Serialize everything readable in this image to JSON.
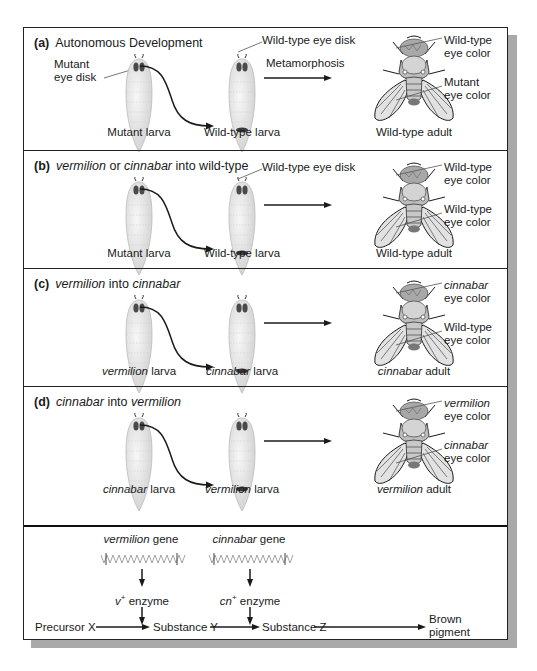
{
  "panels": [
    {
      "letter": "(a)",
      "title_parts": [
        {
          "text": "Autonomous Development",
          "italic": false
        }
      ],
      "left_label_1": "Mutant",
      "left_label_2": "eye disk",
      "donor_larva": [
        {
          "text": "Mutant",
          "italic": false
        },
        {
          "text": " larva",
          "italic": false
        }
      ],
      "host_larva": [
        {
          "text": "Wild-type",
          "italic": false
        },
        {
          "text": " larva",
          "italic": false
        }
      ],
      "host_disk_label": "Wild-type eye disk",
      "arrow_label": "Metamorphosis",
      "adult": [
        {
          "text": "Wild-type",
          "italic": false
        },
        {
          "text": " adult",
          "italic": false
        }
      ],
      "eye_top": [
        {
          "text": "Wild-type",
          "italic": false
        },
        {
          "text": "eye color",
          "italic": false
        }
      ],
      "eye_bottom": [
        {
          "text": "Mutant",
          "italic": false
        },
        {
          "text": "eye color",
          "italic": false
        }
      ]
    },
    {
      "letter": "(b)",
      "title_parts": [
        {
          "text": "vermilion",
          "italic": true
        },
        {
          "text": " or ",
          "italic": false
        },
        {
          "text": "cinnabar",
          "italic": true
        },
        {
          "text": " into wild-type",
          "italic": false
        }
      ],
      "donor_larva": [
        {
          "text": "Mutant",
          "italic": false
        },
        {
          "text": " larva",
          "italic": false
        }
      ],
      "host_larva": [
        {
          "text": "Wild-type",
          "italic": false
        },
        {
          "text": " larva",
          "italic": false
        }
      ],
      "host_disk_label": "Wild-type eye disk",
      "adult": [
        {
          "text": "Wild-type",
          "italic": false
        },
        {
          "text": " adult",
          "italic": false
        }
      ],
      "eye_top": [
        {
          "text": "Wild-type",
          "italic": false
        },
        {
          "text": "eye color",
          "italic": false
        }
      ],
      "eye_bottom": [
        {
          "text": "Wild-type",
          "italic": false
        },
        {
          "text": "eye color",
          "italic": false
        }
      ]
    },
    {
      "letter": "(c)",
      "title_parts": [
        {
          "text": "vermilion",
          "italic": true
        },
        {
          "text": " into ",
          "italic": false
        },
        {
          "text": "cinnabar",
          "italic": true
        }
      ],
      "donor_larva": [
        {
          "text": "vermilion",
          "italic": true
        },
        {
          "text": " larva",
          "italic": false
        }
      ],
      "host_larva": [
        {
          "text": "cinnabar",
          "italic": true
        },
        {
          "text": " larva",
          "italic": false
        }
      ],
      "adult": [
        {
          "text": "cinnabar",
          "italic": true
        },
        {
          "text": " adult",
          "italic": false
        }
      ],
      "eye_top": [
        {
          "text": "cinnabar",
          "italic": true
        },
        {
          "text": "eye color",
          "italic": false
        }
      ],
      "eye_bottom": [
        {
          "text": "Wild-type",
          "italic": false
        },
        {
          "text": "eye color",
          "italic": false
        }
      ]
    },
    {
      "letter": "(d)",
      "title_parts": [
        {
          "text": "cinnabar",
          "italic": true
        },
        {
          "text": " into ",
          "italic": false
        },
        {
          "text": "vermilion",
          "italic": true
        }
      ],
      "donor_larva": [
        {
          "text": "cinnabar",
          "italic": true
        },
        {
          "text": " larva",
          "italic": false
        }
      ],
      "host_larva": [
        {
          "text": "vermilion",
          "italic": true
        },
        {
          "text": " larva",
          "italic": false
        }
      ],
      "adult": [
        {
          "text": "vermilion",
          "italic": true
        },
        {
          "text": " adult",
          "italic": false
        }
      ],
      "eye_top": [
        {
          "text": "vermilion",
          "italic": true
        },
        {
          "text": "eye color",
          "italic": false
        }
      ],
      "eye_bottom": [
        {
          "text": "cinnabar",
          "italic": true
        },
        {
          "text": "eye color",
          "italic": false
        }
      ]
    }
  ],
  "pathway": {
    "gene1": {
      "name": "vermilion",
      "suffix": " gene"
    },
    "gene2": {
      "name": "cinnabar",
      "suffix": " gene"
    },
    "enzyme1": {
      "sym": "v",
      "sup": "+",
      "suffix": " enzyme"
    },
    "enzyme2": {
      "sym": "cn",
      "sup": "+",
      "suffix": " enzyme"
    },
    "steps": [
      "Precursor X",
      "Substance Y",
      "Substance Z"
    ],
    "product_1": "Brown",
    "product_2": "pigment"
  },
  "colors": {
    "line": "#1a1a1a",
    "larva_fill": "#ececec",
    "fly_fill": "#d8d8d8",
    "shadow": "#a9a9a9"
  }
}
